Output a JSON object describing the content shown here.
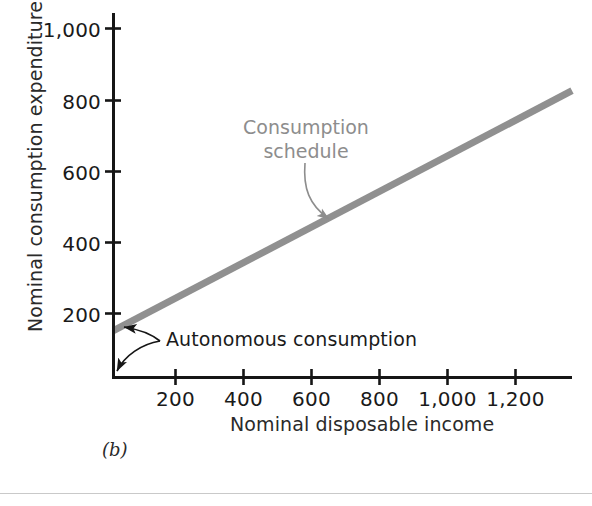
{
  "figure": {
    "panel_label": "(b)",
    "schedule_label_line1": "Consumption",
    "schedule_label_line2": "schedule",
    "autonomous_label": "Autonomous consumption"
  },
  "chart_data": {
    "type": "line",
    "title": "",
    "subtitle": "",
    "xlabel": "Nominal disposable income",
    "ylabel": "Nominal consumption expenditure",
    "xlim": [
      0,
      1350
    ],
    "ylim": [
      0,
      1075
    ],
    "xticks": [
      200,
      400,
      600,
      800,
      1000,
      1200
    ],
    "xticklabels": [
      "200",
      "400",
      "600",
      "800",
      "1,000",
      "1,200"
    ],
    "yticks": [
      200,
      400,
      600,
      800,
      1000
    ],
    "yticklabels": [
      "200",
      "400",
      "600",
      "800",
      "1,000"
    ],
    "grid": false,
    "legend": "none",
    "series": [
      {
        "name": "Consumption schedule",
        "color": "#909090",
        "linewidth": 7,
        "intercept": 150,
        "slope": 0.5,
        "x": [
          0,
          1350
        ],
        "values": [
          150,
          825
        ]
      }
    ],
    "annotations": [
      {
        "name": "consumption-schedule",
        "text": "Consumption schedule",
        "color": "#8d8d8d",
        "x": 700,
        "y": 500
      },
      {
        "name": "autonomous-consumption",
        "text": "Autonomous consumption",
        "color": "#1a1a1a",
        "points": [
          [
            0,
            150
          ],
          [
            0,
            0
          ]
        ]
      }
    ]
  }
}
